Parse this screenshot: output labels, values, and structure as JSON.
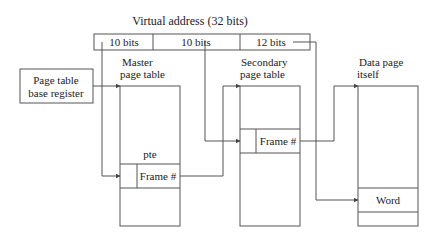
{
  "title": "Virtual address (32 bits)",
  "address_fields": [
    {
      "label": "10 bits"
    },
    {
      "label": "10 bits"
    },
    {
      "label": "12 bits"
    }
  ],
  "ptbr": {
    "line1": "Page table",
    "line2": "base register"
  },
  "master": {
    "line1": "Master",
    "line2": "page table",
    "pte_label": "pte",
    "entry": "Frame #"
  },
  "secondary": {
    "line1": "Secondary",
    "line2": "page table",
    "entry": "Frame #"
  },
  "data_page": {
    "line1": "Data page",
    "line2": "itself",
    "entry": "Word"
  },
  "colors": {
    "line": "#555555",
    "text": "#222222",
    "background": "#ffffff"
  }
}
